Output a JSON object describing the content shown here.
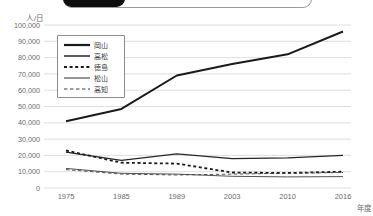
{
  "top_bar": {
    "description": "partially visible rounded selector with active black segment"
  },
  "chart_data": {
    "type": "line",
    "title": "",
    "ylabel": "人/日",
    "xlabel": "年度",
    "categories": [
      "1975",
      "1985",
      "1989",
      "2003",
      "2010",
      "2016"
    ],
    "series": [
      {
        "name": "岡山",
        "style": "solid-thick",
        "values": [
          41000,
          48500,
          69000,
          76000,
          82000,
          96000
        ]
      },
      {
        "name": "高松",
        "style": "solid-medium",
        "values": [
          22000,
          17000,
          21000,
          18000,
          18500,
          20000
        ]
      },
      {
        "name": "徳島",
        "style": "dashed-thick",
        "values": [
          23000,
          15500,
          15000,
          9500,
          9200,
          10000
        ]
      },
      {
        "name": "松山",
        "style": "solid-thin",
        "values": [
          12000,
          9000,
          8500,
          7200,
          6800,
          7000
        ]
      },
      {
        "name": "高知",
        "style": "dashed-thin",
        "values": [
          11300,
          8500,
          8000,
          8500,
          9000,
          9500
        ]
      }
    ],
    "ylim": [
      0,
      100000
    ],
    "ytick_step": 10000,
    "ytick_labels": [
      "0",
      "10,000",
      "20,000",
      "30,000",
      "40,000",
      "50,000",
      "60,000",
      "70,000",
      "80,000",
      "90,000",
      "100,000"
    ],
    "grid": "horizontal",
    "legend_position": "upper-left",
    "colors": {
      "line": "#1a1a1a",
      "grid": "#d6d6d6",
      "axis_text": "#6b6b6b"
    }
  }
}
